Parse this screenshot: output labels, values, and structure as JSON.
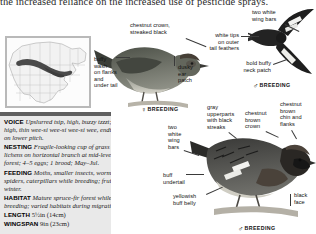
{
  "page": {
    "running_text": "the increased reliance on the increased use of pesticide sprays."
  },
  "map": {
    "name": "north-america-range-map",
    "legend": "breeding range shaded"
  },
  "info": {
    "entries": [
      {
        "key": "VOICE",
        "text": "Upslurred tsip, high, buzzy tzzzt; high, thin wee-si wee-si wee-si wee, ending on lower pitch."
      },
      {
        "key": "NESTING",
        "text": "Fragile-looking cup of grass and lichens on horizontal branch at mid-level in forest; 4–5 eggs; 1 brood; May–Jul."
      },
      {
        "key": "FEEDING",
        "text": "Moths, smaller insects, worms, spiders, caterpillars while breeding; fruit in winter."
      },
      {
        "key": "HABITAT",
        "text": "Mature spruce-fir forest while breeding; varied habitats during migration."
      },
      {
        "key": "LENGTH",
        "text": "5½in (14cm)"
      },
      {
        "key": "WINGSPAN",
        "text": "9in (23cm)"
      }
    ]
  },
  "labels": {
    "chestnut_crown": "chestnut crown,\nstreaked black",
    "two_white_bars_top": "two white\nwing bars",
    "white_tips_tail": "white tips\non outer\ntail feathers",
    "buffy_wash": "buffy\nwash\non flanks\nand\nunder tail",
    "dusky_ear": "dusky\near\npatch",
    "bold_buffy_neck": "bold buffy\nneck patch",
    "gray_upperparts": "gray\nupperparts\nwith black\nstreaks",
    "chestnut_brown_crown": "chestnut\nbrown\ncrown",
    "chestnut_chin": "chestnut\nbrown\nchin and\nflanks",
    "two_white_bars_bottom": "two\nwhite\nwing\nbars",
    "buff_undertail": "buff\nundertail",
    "yellowish_belly": "yellowish\nbuff belly",
    "black_face": "black\nface"
  },
  "breeding_tags": {
    "female_upper": {
      "symbol": "♀",
      "text": "BREEDING"
    },
    "male_upper": {
      "symbol": "♂",
      "text": "BREEDING"
    },
    "male_lower": {
      "symbol": "♂",
      "text": "BREEDING"
    }
  },
  "colors": {
    "panel_bg": "#e9e9e9",
    "panel_bar": "#5f5f5f",
    "leader": "#3a3a3a",
    "map_range": "#4a4a4a"
  }
}
